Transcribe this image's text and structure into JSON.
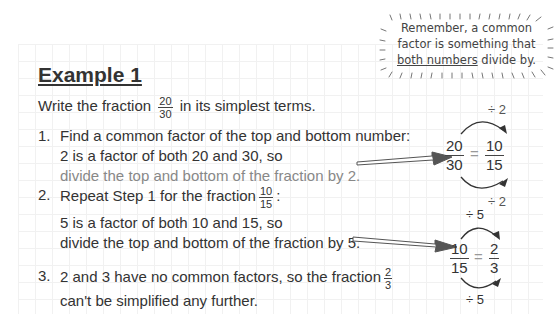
{
  "note": {
    "line1": "Remember, a common",
    "line2": "factor is something that",
    "line3_underlined": "both numbers",
    "line3_rest": " divide by."
  },
  "example": {
    "title": "Example 1",
    "intro_before": "Write the fraction",
    "intro_fraction": {
      "num": "20",
      "den": "30"
    },
    "intro_after": "in its simplest terms."
  },
  "steps": [
    {
      "number": "1.",
      "line1": "Find a common factor of the top and bottom number:",
      "line2": "2 is a factor of both 20 and 30, so",
      "line3": "divide the top and bottom of the fraction by 2."
    },
    {
      "number": "2.",
      "line1_before": "Repeat Step 1 for the fraction",
      "line1_fraction": {
        "num": "10",
        "den": "15"
      },
      "line1_after": ":",
      "line2": "5 is a factor of both 10 and 15, so",
      "line3": "divide the top and bottom of the fraction by 5."
    },
    {
      "number": "3.",
      "line1_before": "2 and 3 have no common factors, so the fraction",
      "line1_fraction": {
        "num": "2",
        "den": "3"
      },
      "line2": "can't be simplified any further."
    }
  ],
  "diagrams": [
    {
      "top_label": "÷ 2",
      "bottom_label": "÷ 2",
      "left": {
        "num": "20",
        "den": "30"
      },
      "equals": "=",
      "right": {
        "num": "10",
        "den": "15"
      }
    },
    {
      "top_label": "÷ 5",
      "bottom_label": "÷ 5",
      "left": {
        "num": "10",
        "den": "15"
      },
      "equals": "=",
      "right": {
        "num": "2",
        "den": "3"
      }
    }
  ]
}
